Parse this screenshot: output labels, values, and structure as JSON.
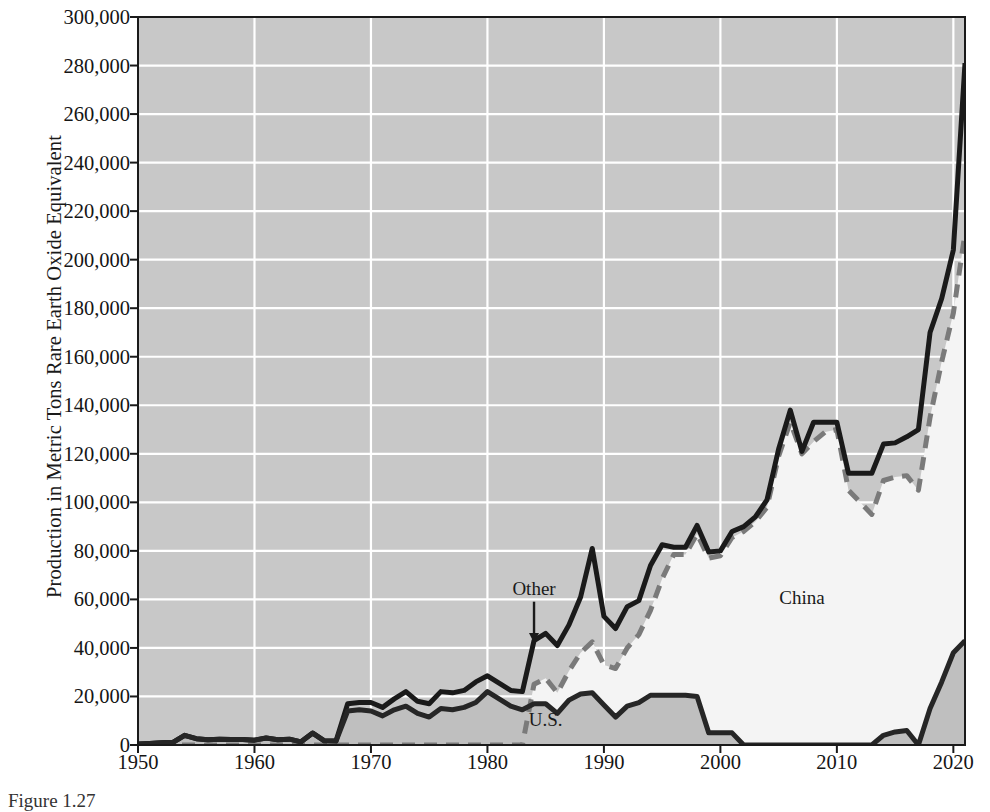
{
  "chart_data": {
    "type": "area",
    "title": "",
    "subtitle": "",
    "xlabel": "",
    "ylabel": "Production in Metric Tons Rare Earth Oxide Equivalent",
    "xlim": [
      1950,
      2021
    ],
    "ylim": [
      0,
      300000
    ],
    "ytick_step": 20000,
    "xtick_step": 10,
    "grid": true,
    "grid_color": "#ffffff",
    "legend_position": "inline-annotations",
    "stacked": true,
    "y_ticks": [
      "0",
      "20,000",
      "40,000",
      "60,000",
      "80,000",
      "100,000",
      "120,000",
      "140,000",
      "160,000",
      "180,000",
      "200,000",
      "220,000",
      "240,000",
      "260,000",
      "280,000",
      "300,000"
    ],
    "y_tick_values": [
      0,
      20000,
      40000,
      60000,
      80000,
      100000,
      120000,
      140000,
      160000,
      180000,
      200000,
      220000,
      240000,
      260000,
      280000,
      300000
    ],
    "x_ticks": [
      "1950",
      "1960",
      "1970",
      "1980",
      "1990",
      "2000",
      "2010",
      "2020"
    ],
    "x_tick_values": [
      1950,
      1960,
      1970,
      1980,
      1990,
      2000,
      2010,
      2020
    ],
    "annotations": [
      {
        "text": "Other",
        "x": 1984,
        "y": 64000,
        "arrow_to_y": 42000,
        "name": "other-label"
      },
      {
        "text": "China",
        "x": 2007,
        "y": 60000,
        "name": "china-label"
      },
      {
        "text": "U.S.",
        "x": 1985,
        "y": 10000,
        "name": "us-label"
      }
    ],
    "x": [
      1950,
      1951,
      1952,
      1953,
      1954,
      1955,
      1956,
      1957,
      1958,
      1959,
      1960,
      1961,
      1962,
      1963,
      1964,
      1965,
      1966,
      1967,
      1968,
      1969,
      1970,
      1971,
      1972,
      1973,
      1974,
      1975,
      1976,
      1977,
      1978,
      1979,
      1980,
      1981,
      1982,
      1983,
      1984,
      1985,
      1986,
      1987,
      1988,
      1989,
      1990,
      1991,
      1992,
      1993,
      1994,
      1995,
      1996,
      1997,
      1998,
      1999,
      2000,
      2001,
      2002,
      2003,
      2004,
      2005,
      2006,
      2007,
      2008,
      2009,
      2010,
      2011,
      2012,
      2013,
      2014,
      2015,
      2016,
      2017,
      2018,
      2019,
      2020,
      2021
    ],
    "series": [
      {
        "name": "U.S.",
        "color": "#bfbfbf",
        "line_color": "#262626",
        "line_style": "solid",
        "values": [
          400,
          600,
          900,
          1100,
          4000,
          2600,
          2200,
          2400,
          2300,
          2300,
          2000,
          2900,
          2200,
          2400,
          1300,
          4900,
          1700,
          1600,
          14000,
          14500,
          14000,
          12000,
          14500,
          16000,
          13000,
          11500,
          15000,
          14500,
          15500,
          17500,
          22000,
          19000,
          16000,
          14500,
          17000,
          17000,
          13000,
          18500,
          21000,
          21500,
          16500,
          11500,
          16000,
          17500,
          20500,
          20500,
          20500,
          20500,
          20000,
          5000,
          5000,
          5000,
          0,
          0,
          0,
          0,
          0,
          0,
          0,
          0,
          0,
          0,
          0,
          0,
          4000,
          5400,
          6000,
          0,
          15000,
          26000,
          38000,
          43000
        ]
      },
      {
        "name": "China",
        "color": "#f4f4f4",
        "line_color": "#7a7a7a",
        "line_style": "dashed",
        "values": [
          0,
          0,
          0,
          0,
          0,
          0,
          0,
          0,
          0,
          0,
          0,
          0,
          0,
          0,
          0,
          0,
          0,
          0,
          0,
          0,
          0,
          0,
          0,
          0,
          0,
          0,
          0,
          0,
          0,
          0,
          1000,
          1500,
          2000,
          3000,
          8000,
          10500,
          8500,
          12000,
          17000,
          21000,
          16500,
          20000,
          24000,
          28000,
          35000,
          48000,
          58000,
          58000,
          67000,
          72000,
          73000,
          80500,
          88000,
          92000,
          98000,
          119000,
          133000,
          120000,
          125000,
          129000,
          130000,
          105000,
          100000,
          95000,
          105000,
          105000,
          105000,
          105000,
          120000,
          132000,
          140000,
          168000
        ]
      },
      {
        "name": "Other",
        "color": "#c8c8c8",
        "line_color": "#1a1a1a",
        "line_style": "solid",
        "values": [
          0,
          0,
          0,
          0,
          0,
          0,
          0,
          0,
          0,
          0,
          0,
          0,
          0,
          0,
          0,
          0,
          0,
          0,
          3000,
          3000,
          3500,
          3500,
          4500,
          6000,
          5000,
          5500,
          7000,
          7000,
          7000,
          8500,
          5500,
          5000,
          4500,
          4500,
          18000,
          18500,
          19500,
          19000,
          23000,
          38500,
          20500,
          16500,
          17000,
          14000,
          18500,
          14000,
          3000,
          3000,
          3500,
          2500,
          2000,
          2500,
          2000,
          2000,
          3000,
          3000,
          5000,
          1000,
          8000,
          4000,
          3000,
          7000,
          12000,
          17000,
          15000,
          14500,
          16000,
          25000,
          35000,
          52000,
          62000,
          70000
        ]
      }
    ],
    "totals": [
      400,
      600,
      900,
      1100,
      4000,
      2600,
      2200,
      2400,
      2300,
      2300,
      2000,
      2900,
      2200,
      2400,
      1300,
      4900,
      1700,
      1600,
      17000,
      17500,
      17500,
      15500,
      19000,
      22000,
      18000,
      17000,
      22000,
      21500,
      22500,
      26000,
      28500,
      25500,
      22500,
      22000,
      43000,
      46000,
      41000,
      49500,
      61000,
      81000,
      53000,
      48000,
      57000,
      59500,
      74000,
      82500,
      81500,
      81500,
      90500,
      79500,
      80000,
      88000,
      90000,
      94000,
      101000,
      122000,
      138000,
      121000,
      133000,
      133000,
      133000,
      112000,
      112000,
      112000,
      124000,
      124500,
      127000,
      130000,
      170000,
      184000,
      204000,
      281000
    ],
    "china_line_values": [
      0,
      0,
      0,
      0,
      0,
      0,
      0,
      0,
      0,
      0,
      0,
      0,
      0,
      0,
      0,
      0,
      0,
      0,
      0,
      0,
      0,
      0,
      0,
      0,
      0,
      0,
      0,
      0,
      0,
      0,
      0,
      0,
      0,
      0,
      25000,
      27500,
      21500,
      30500,
      38000,
      42500,
      33000,
      31500,
      40000,
      45500,
      55500,
      68500,
      78500,
      78500,
      87000,
      77000,
      78000,
      85500,
      88000,
      92000,
      98000,
      119000,
      133000,
      120000,
      125000,
      129000,
      130000,
      105000,
      100000,
      95000,
      109000,
      110400,
      111000,
      105000,
      135000,
      158000,
      178000,
      211000
    ]
  },
  "caption": "Figure 1.27"
}
